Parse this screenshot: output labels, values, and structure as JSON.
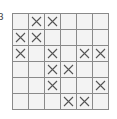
{
  "label": "3",
  "grid": {
    "rows": 6,
    "cols": 6,
    "marks": [
      [
        0,
        1,
        1,
        0,
        0,
        0
      ],
      [
        1,
        1,
        0,
        0,
        0,
        0
      ],
      [
        1,
        0,
        1,
        0,
        1,
        1
      ],
      [
        0,
        0,
        1,
        1,
        0,
        0
      ],
      [
        0,
        0,
        1,
        0,
        0,
        1
      ],
      [
        0,
        0,
        0,
        1,
        1,
        0
      ]
    ],
    "mark_icon": "x-icon",
    "line_color": "#8a8a8a",
    "mark_color": "#555555"
  }
}
